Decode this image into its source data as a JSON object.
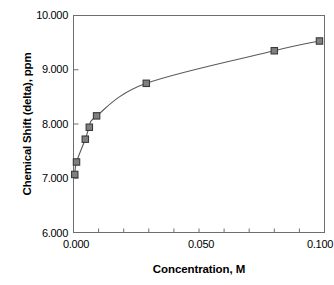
{
  "chart_data": {
    "type": "scatter",
    "title": "",
    "xlabel": "Concentration, M",
    "ylabel": "Chemical Shift (delta), ppm",
    "xlim": [
      0.0,
      0.1
    ],
    "ylim": [
      6.0,
      10.0
    ],
    "grid": false,
    "legend": null,
    "marker": "filled-square",
    "marker_color": "#808080",
    "marker_edge_color": "#404040",
    "line_color": "#595959",
    "line_style": "smooth-curve",
    "x_tick_labels": [
      "0.000",
      "0.050",
      "0.100"
    ],
    "x_tick_values": [
      0.0,
      0.05,
      0.1
    ],
    "x_minor_tick_step": 0.01,
    "y_tick_labels": [
      "10.000",
      "9.000",
      "8.000",
      "7.000",
      "6.000"
    ],
    "y_tick_values": [
      10.0,
      9.0,
      8.0,
      7.0,
      6.0
    ],
    "series": [
      {
        "name": "Chemical shift vs concentration",
        "x": [
          0.0005,
          0.0012,
          0.0047,
          0.0063,
          0.0092,
          0.029,
          0.08,
          0.098
        ],
        "y": [
          7.07,
          7.3,
          7.72,
          7.94,
          8.15,
          8.75,
          9.35,
          9.53
        ]
      }
    ]
  },
  "axes": {
    "x_title": "Concentration, M",
    "y_title": "Chemical Shift (delta), ppm"
  },
  "colors": {
    "frame": "#6e6e6e",
    "marker_fill": "#808080",
    "marker_edge": "#3a3a3a",
    "curve": "#5a5a5a",
    "text": "#000000"
  }
}
